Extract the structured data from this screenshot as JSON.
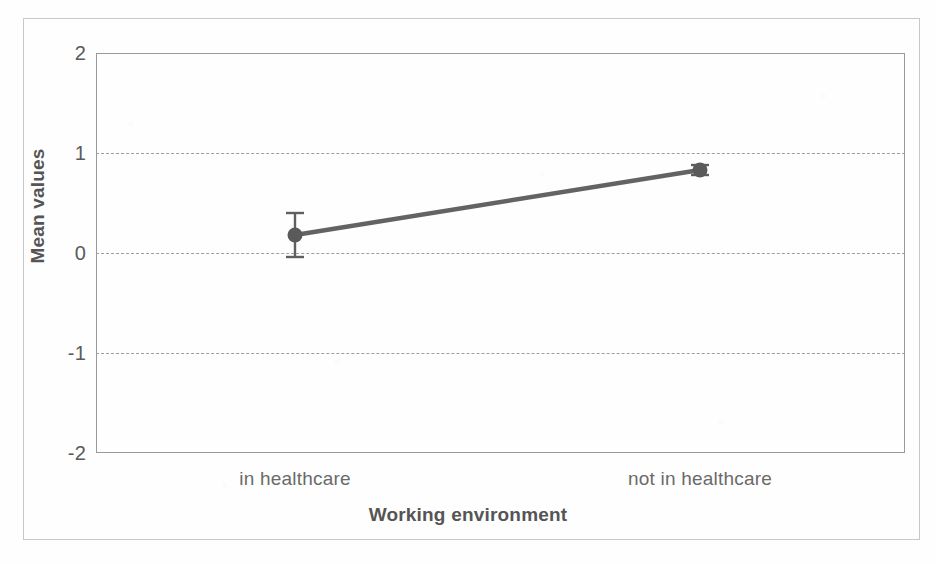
{
  "chart_data": {
    "type": "line",
    "title": "",
    "xlabel": "Working environment",
    "ylabel": "Mean values",
    "categories": [
      "in healthcare",
      "not in healthcare"
    ],
    "series": [
      {
        "name": "Mean values",
        "values": [
          0.18,
          0.83
        ],
        "errors": [
          0.22,
          0.05
        ]
      }
    ],
    "yticks": [
      "2",
      "1",
      "0",
      "-1",
      "-2"
    ],
    "ytick_values": [
      2,
      1,
      0,
      -1,
      -2
    ],
    "ylim": [
      -2,
      2
    ],
    "grid": "horizontal-dashed",
    "gridline_values": [
      1,
      0,
      -1
    ],
    "legend": "none",
    "marker": "circle",
    "error_bars": true,
    "colors": {
      "line": "#636363",
      "marker": "#5a5a5a",
      "error_bar": "#5f5f5f",
      "gridline": "#9e9e9e",
      "plot_border": "#9a9a9a",
      "outer_border": "#c8c8c8",
      "axis_text": "#5a5a5a",
      "axis_title_text": "#555555",
      "background": "#ffffff"
    }
  },
  "axis": {
    "y_title": "Mean values",
    "x_title": "Working environment",
    "y_ticks": [
      {
        "label": "2"
      },
      {
        "label": "1"
      },
      {
        "label": "0"
      },
      {
        "label": "-1"
      },
      {
        "label": "-2"
      }
    ],
    "x_ticks": [
      {
        "label": "in healthcare"
      },
      {
        "label": "not in healthcare"
      }
    ]
  }
}
